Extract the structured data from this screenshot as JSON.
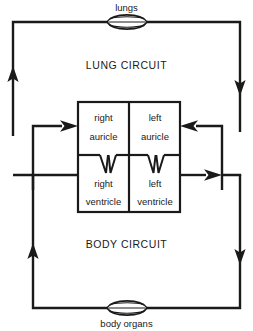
{
  "diagram": {
    "colors": {
      "line": "#1a1a1a",
      "text": "#1a1a1a",
      "background": "#ffffff"
    },
    "organs": {
      "top": {
        "label": "lungs",
        "icon": "lungs-icon"
      },
      "bottom": {
        "label": "body organs",
        "icon": "body-organs-icon"
      }
    },
    "circuits": [
      {
        "id": "lung",
        "label": "LUNG CIRCUIT"
      },
      {
        "id": "body",
        "label": "BODY CIRCUIT"
      }
    ],
    "heart": {
      "chambers": [
        {
          "id": "right-auricle",
          "line1": "right",
          "line2": "auricle"
        },
        {
          "id": "left-auricle",
          "line1": "left",
          "line2": "auricle"
        },
        {
          "id": "right-ventricle",
          "line1": "right",
          "line2": "ventricle"
        },
        {
          "id": "left-ventricle",
          "line1": "left",
          "line2": "ventricle"
        }
      ]
    },
    "flow_arrows": [
      {
        "id": "lung-return-up-left",
        "direction": "up"
      },
      {
        "id": "lung-out-right-down",
        "direction": "down"
      },
      {
        "id": "into-left-auricle",
        "direction": "left"
      },
      {
        "id": "out-of-right-auricle",
        "direction": "right"
      },
      {
        "id": "out-of-left-ventricle",
        "direction": "right"
      },
      {
        "id": "body-out-right-down",
        "direction": "down"
      },
      {
        "id": "body-return-up-left",
        "direction": "up"
      }
    ]
  }
}
